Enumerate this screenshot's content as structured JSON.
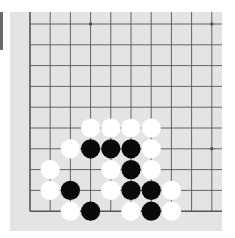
{
  "board": {
    "colors": {
      "background": "#e4e4e4",
      "line": "#555555",
      "black_stone": "#0a0a0a",
      "white_stone": "#ffffff",
      "side_bar": "#6a6a6a"
    },
    "columns_x": [
      30,
      50.2,
      70.4,
      90.6,
      110.8,
      131,
      151.2,
      171.4,
      191.6,
      211.8
    ],
    "rows_y": [
      24,
      44.8,
      65.6,
      86.4,
      107.2,
      128,
      148.8,
      169.6,
      190.4,
      211.2
    ],
    "edges": [
      "left",
      "bottom"
    ],
    "star_points": [
      {
        "col": 3,
        "row": 0
      },
      {
        "col": 9,
        "row": 0
      },
      {
        "col": 9,
        "row": 6
      }
    ],
    "stones": [
      {
        "color": "white",
        "col": 3,
        "row": 5
      },
      {
        "color": "white",
        "col": 4,
        "row": 5
      },
      {
        "color": "white",
        "col": 5,
        "row": 5
      },
      {
        "color": "white",
        "col": 6,
        "row": 5
      },
      {
        "color": "white",
        "col": 2,
        "row": 6
      },
      {
        "color": "black",
        "col": 3,
        "row": 6
      },
      {
        "color": "black",
        "col": 4,
        "row": 6
      },
      {
        "color": "black",
        "col": 5,
        "row": 6
      },
      {
        "color": "white",
        "col": 6,
        "row": 6
      },
      {
        "color": "white",
        "col": 1,
        "row": 7
      },
      {
        "color": "white",
        "col": 4,
        "row": 7
      },
      {
        "color": "black",
        "col": 5,
        "row": 7
      },
      {
        "color": "white",
        "col": 6,
        "row": 7
      },
      {
        "color": "white",
        "col": 1,
        "row": 8
      },
      {
        "color": "black",
        "col": 2,
        "row": 8
      },
      {
        "color": "white",
        "col": 4,
        "row": 8
      },
      {
        "color": "black",
        "col": 5,
        "row": 8
      },
      {
        "color": "black",
        "col": 6,
        "row": 8
      },
      {
        "color": "white",
        "col": 7,
        "row": 8
      },
      {
        "color": "white",
        "col": 2,
        "row": 9
      },
      {
        "color": "black",
        "col": 3,
        "row": 9
      },
      {
        "color": "white",
        "col": 5,
        "row": 9
      },
      {
        "color": "black",
        "col": 6,
        "row": 9
      },
      {
        "color": "white",
        "col": 7,
        "row": 9
      }
    ]
  }
}
